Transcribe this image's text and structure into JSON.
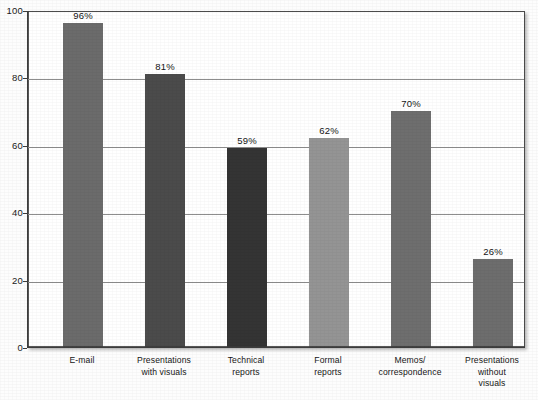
{
  "chart_data": {
    "type": "bar",
    "title": "",
    "xlabel": "",
    "ylabel": "",
    "ylim": [
      0,
      100
    ],
    "grid": true,
    "legend": "none",
    "categories": [
      "E-mail",
      "Presentations\nwith visuals",
      "Technical\nreports",
      "Formal\nreports",
      "Memos/\ncorrespondence",
      "Presentations\nwithout\nvisuals"
    ],
    "values": [
      96,
      81,
      59,
      62,
      70,
      26
    ],
    "value_labels": [
      "96%",
      "81%",
      "59%",
      "62%",
      "70%",
      "26%"
    ],
    "bar_colors": [
      "#6b6b6b",
      "#4b4b4b",
      "#343434",
      "#949494",
      "#6e6e6e",
      "#6d6d6d"
    ],
    "ytick_labels": [
      "0",
      "20",
      "40",
      "60",
      "80",
      "100"
    ],
    "ytick_values": [
      0,
      20,
      40,
      60,
      80,
      100
    ]
  },
  "axis": {
    "frame_color": "#3b3b3b",
    "gridline_color": "#8d8d8d"
  }
}
